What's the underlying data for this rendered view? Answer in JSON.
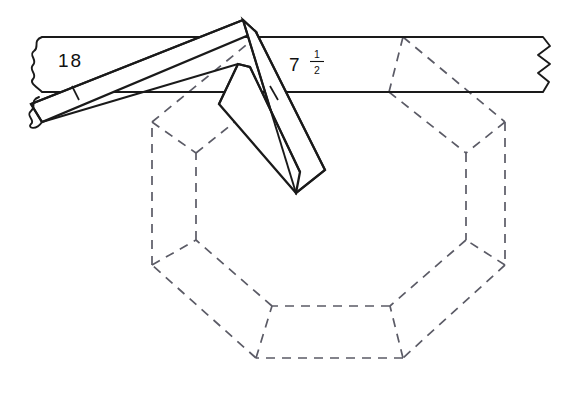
{
  "figure": {
    "background_color": "#ffffff",
    "line_color": "#1a1a1a",
    "hidden_line_color": "#5b5b66"
  },
  "dimensions": {
    "board_width_label": "18",
    "offset_label_whole": "7",
    "offset_label_numerator": "1",
    "offset_label_denominator": "2",
    "offset_label_full": "7 1/2"
  },
  "board": {
    "name": "board-stock",
    "top_edge_y": 37,
    "bottom_edge_y": 92,
    "break_line_count": 3
  },
  "tool": {
    "name": "framing-square",
    "blade_label": "blade",
    "tongue_label": "tongue"
  },
  "octagon": {
    "name": "octagon-frame-layout",
    "side_count": 8,
    "style": "hidden-dashed"
  }
}
